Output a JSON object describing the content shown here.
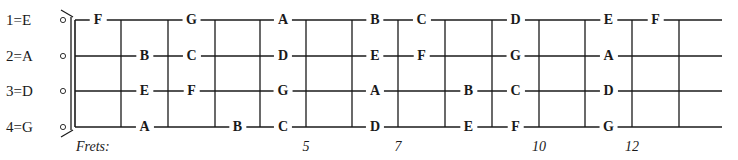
{
  "diagram": {
    "strings": [
      {
        "label": "1=E",
        "open_note": "E",
        "notes": [
          {
            "fret": 1,
            "note": "F"
          },
          {
            "fret": 3,
            "note": "G"
          },
          {
            "fret": 5,
            "note": "A"
          },
          {
            "fret": 7,
            "note": "B"
          },
          {
            "fret": 8,
            "note": "C"
          },
          {
            "fret": 10,
            "note": "D"
          },
          {
            "fret": 12,
            "note": "E"
          },
          {
            "fret": 13,
            "note": "F"
          }
        ]
      },
      {
        "label": "2=A",
        "open_note": "A",
        "notes": [
          {
            "fret": 2,
            "note": "B"
          },
          {
            "fret": 3,
            "note": "C"
          },
          {
            "fret": 5,
            "note": "D"
          },
          {
            "fret": 7,
            "note": "E"
          },
          {
            "fret": 8,
            "note": "F"
          },
          {
            "fret": 10,
            "note": "G"
          },
          {
            "fret": 12,
            "note": "A"
          }
        ]
      },
      {
        "label": "3=D",
        "open_note": "D",
        "notes": [
          {
            "fret": 2,
            "note": "E"
          },
          {
            "fret": 3,
            "note": "F"
          },
          {
            "fret": 5,
            "note": "G"
          },
          {
            "fret": 7,
            "note": "A"
          },
          {
            "fret": 9,
            "note": "B"
          },
          {
            "fret": 10,
            "note": "C"
          },
          {
            "fret": 12,
            "note": "D"
          }
        ]
      },
      {
        "label": "4=G",
        "open_note": "G",
        "notes": [
          {
            "fret": 2,
            "note": "A"
          },
          {
            "fret": 4,
            "note": "B"
          },
          {
            "fret": 5,
            "note": "C"
          },
          {
            "fret": 7,
            "note": "D"
          },
          {
            "fret": 9,
            "note": "E"
          },
          {
            "fret": 10,
            "note": "F"
          },
          {
            "fret": 12,
            "note": "G"
          }
        ]
      }
    ],
    "frets_caption": "Frets:",
    "fret_numbers": [
      {
        "fret": 5,
        "label": "5"
      },
      {
        "fret": 7,
        "label": "7"
      },
      {
        "fret": 10,
        "label": "10"
      },
      {
        "fret": 12,
        "label": "12"
      }
    ],
    "fret_count": 13,
    "colors": {
      "ink": "#1a1a1a",
      "background": "#ffffff"
    }
  }
}
